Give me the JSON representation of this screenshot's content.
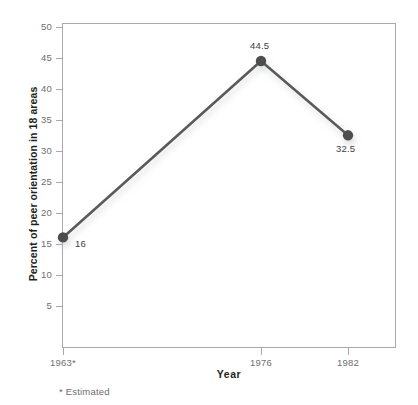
{
  "chart_data": {
    "type": "line",
    "title": "",
    "xlabel": "Year",
    "ylabel": "Percent of peer orientation in 18 areas",
    "categories": [
      "1963*",
      "1976",
      "1982"
    ],
    "x": [
      1963,
      1976,
      1982
    ],
    "values": [
      16,
      44.5,
      32.5
    ],
    "point_labels": [
      "16",
      "44.5",
      "32.5"
    ],
    "series": [
      {
        "name": "Percent of peer orientation in 18 areas",
        "values": [
          16,
          44.5,
          32.5
        ]
      }
    ],
    "ylim": [
      0,
      50
    ],
    "yticks": [
      5,
      10,
      15,
      20,
      25,
      30,
      35,
      40,
      45,
      50
    ],
    "ytick_labels": [
      "5",
      "10",
      "15",
      "20",
      "25",
      "30",
      "35",
      "40",
      "45",
      "50"
    ],
    "xtick_labels": [
      "1963*",
      "1976",
      "1982"
    ],
    "grid": false,
    "legend": "none",
    "footnote": "* Estimated",
    "colors": {
      "line": "#595a5c",
      "marker": "#4d4e50",
      "axis": "#a7a9ac",
      "tick_text": "#6d6e71",
      "title_text": "#231f20",
      "background": "#ffffff"
    }
  }
}
